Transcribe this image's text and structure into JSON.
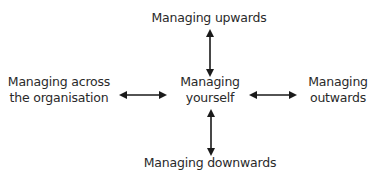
{
  "diagram": {
    "center": {
      "lines": [
        "Managing",
        "yourself"
      ]
    },
    "top": {
      "lines": [
        "Managing upwards"
      ]
    },
    "bottom": {
      "lines": [
        "Managing downwards"
      ]
    },
    "left": {
      "lines": [
        "Managing across",
        "the organisation"
      ]
    },
    "right": {
      "lines": [
        "Managing",
        "outwards"
      ]
    },
    "arrows": [
      {
        "from": "center",
        "to": "top",
        "type": "bidirectional"
      },
      {
        "from": "center",
        "to": "bottom",
        "type": "bidirectional"
      },
      {
        "from": "center",
        "to": "left",
        "type": "bidirectional"
      },
      {
        "from": "center",
        "to": "right",
        "type": "bidirectional"
      }
    ],
    "colors": {
      "text": "#2a2a2a",
      "arrow": "#1a1a1a",
      "background": "#ffffff"
    }
  }
}
